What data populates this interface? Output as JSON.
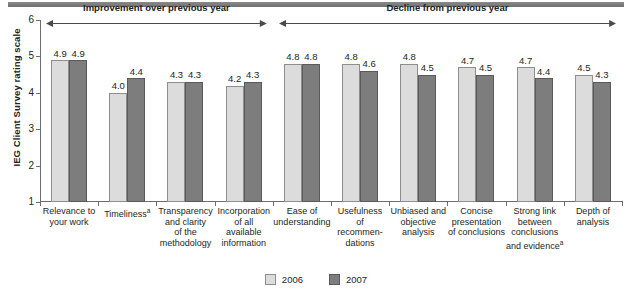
{
  "chart_data": {
    "type": "bar",
    "title": "",
    "xlabel": "",
    "ylabel": "IEG Client Survey rating scale",
    "ylim": [
      1,
      6
    ],
    "yticks": [
      1,
      2,
      3,
      4,
      5,
      6
    ],
    "grid": false,
    "legend_position": "bottom-center",
    "categories": [
      "Relevance to your work",
      "Timelinessᵃ",
      "Transparency and clarity of the methodology",
      "Incorporation of all available information",
      "Ease of understanding",
      "Usefulness of recommen- dations",
      "Unbiased and objective analysis",
      "Concise presentation of conclusions",
      "Strong link between conclusions and evidenceᵃ",
      "Depth of analysis"
    ],
    "series": [
      {
        "name": "2006",
        "color": "#dcdcdc",
        "values": [
          4.9,
          4.0,
          4.3,
          4.2,
          4.8,
          4.8,
          4.8,
          4.7,
          4.7,
          4.5
        ]
      },
      {
        "name": "2007",
        "color": "#7d7d7d",
        "values": [
          4.9,
          4.4,
          4.3,
          4.3,
          4.8,
          4.6,
          4.5,
          4.5,
          4.4,
          4.3
        ]
      }
    ],
    "annotations": [
      {
        "text": "Improvement over previous year",
        "span": [
          0,
          3
        ]
      },
      {
        "text": "Decline from previous year",
        "span": [
          4,
          9
        ]
      }
    ]
  },
  "categories_lines": [
    [
      "Relevance to",
      "your work"
    ],
    [
      "Timeliness"
    ],
    [
      "Transparency",
      "and clarity",
      "of the",
      "methodology"
    ],
    [
      "Incorporation",
      "of all",
      "available",
      "information"
    ],
    [
      "Ease of",
      "understanding"
    ],
    [
      "Usefulness",
      "of",
      "recommen-",
      "dations"
    ],
    [
      "Unbiased and",
      "objective",
      "analysis"
    ],
    [
      "Concise",
      "presentation",
      "of conclusions"
    ],
    [
      "Strong link",
      "between",
      "conclusions",
      "and evidence"
    ],
    [
      "Depth of",
      "analysis"
    ]
  ],
  "legend": {
    "items": [
      {
        "label": "2006",
        "color": "#dcdcdc"
      },
      {
        "label": "2007",
        "color": "#7d7d7d"
      }
    ]
  },
  "axis": {
    "y_title": "IEG Client Survey rating scale",
    "y_tick_labels": [
      "6",
      "5",
      "4",
      "3",
      "2",
      "1"
    ]
  },
  "annotations": {
    "left": "Improvement over previous year",
    "right": "Decline from previous year"
  },
  "colors": {
    "series_2006": "#dcdcdc",
    "series_2007": "#7d7d7d",
    "axis": "#6d6d6d",
    "text": "#231f20",
    "top_rule": "#7a7a7a"
  }
}
